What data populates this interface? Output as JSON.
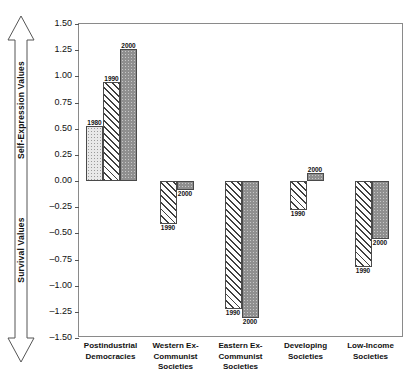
{
  "axis_arrow": {
    "top_label": "Self-Expression Values",
    "bottom_label": "Survival Values"
  },
  "chart_data": {
    "type": "bar",
    "title": "",
    "xlabel": "",
    "ylabel": "",
    "ylim": [
      -1.5,
      1.5
    ],
    "ytick_step": 0.25,
    "grid": false,
    "legend_position": "none",
    "value_labels_shown": true,
    "yticks": [
      "1.50",
      "1.25",
      "1.00",
      "0.75",
      "0.50",
      "0.25",
      "0.00",
      "-0.25",
      "-0.50",
      "-0.75",
      "-1.00",
      "-1.25",
      "-1.50"
    ],
    "categories": [
      "Postindustrial Democracies",
      "Western Ex-Communist Societies",
      "Eastern Ex-Communist Societies",
      "Developing Societies",
      "Low-Income Societies"
    ],
    "category_lines": [
      [
        "Postindustrial",
        "Democracies"
      ],
      [
        "Western Ex-",
        "Communist",
        "Societies"
      ],
      [
        "Eastern Ex-",
        "Communist",
        "Societies"
      ],
      [
        "Developing",
        "Societies"
      ],
      [
        "Low-Income",
        "Societies"
      ]
    ],
    "series": [
      {
        "name": "1980",
        "fill": "dotted",
        "values": [
          0.53,
          null,
          null,
          null,
          null
        ]
      },
      {
        "name": "1990",
        "fill": "hatched",
        "values": [
          0.95,
          -0.41,
          -1.22,
          -0.28,
          -0.82
        ]
      },
      {
        "name": "2000",
        "fill": "solid",
        "values": [
          1.26,
          -0.09,
          -1.31,
          0.08,
          -0.55
        ]
      }
    ]
  },
  "colors": {
    "frame": "#8a8a8a",
    "bar_outline": "#4a4a4a",
    "solid_fill": "#8f8f8f",
    "dotted_fill": "#e8e8e8",
    "text": "#111111"
  }
}
